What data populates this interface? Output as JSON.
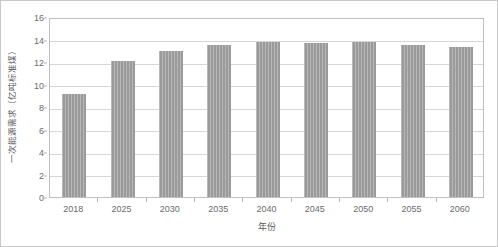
{
  "chart_data": {
    "type": "bar",
    "title": "",
    "xlabel": "年份",
    "ylabel": "一次能源需求（亿吨标准煤）",
    "categories": [
      "2018",
      "2025",
      "2030",
      "2035",
      "2040",
      "2045",
      "2050",
      "2055",
      "2060"
    ],
    "values": [
      9.2,
      12.1,
      13.0,
      13.5,
      13.8,
      13.7,
      13.8,
      13.5,
      13.3
    ],
    "series": [
      {
        "name": "一次能源需求",
        "values": [
          9.2,
          12.1,
          13.0,
          13.5,
          13.8,
          13.7,
          13.8,
          13.5,
          13.3
        ]
      }
    ],
    "ylim": [
      0,
      16
    ],
    "ytick_values": [
      0,
      2,
      4,
      6,
      8,
      10,
      12,
      14,
      16
    ],
    "ytick_labels": [
      "0",
      "2",
      "4",
      "6",
      "8",
      "10",
      "12",
      "14",
      "16"
    ],
    "grid": true,
    "grid_axis": "y",
    "legend": false,
    "legend_position": "none",
    "bar_color": "#9a9a9a",
    "grid_color": "#d6d6d6",
    "axis_color": "#bfbfbf",
    "text_color": "#6b6b6b",
    "background": "#ffffff"
  }
}
